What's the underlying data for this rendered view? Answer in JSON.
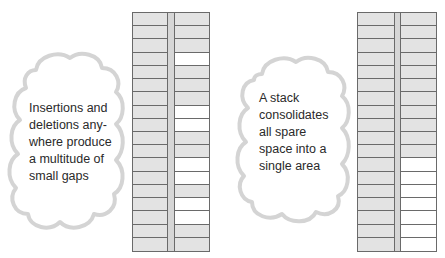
{
  "colors": {
    "cell_used": "#e3e3e3",
    "cell_free": "#ffffff",
    "line": "#6a6a6a",
    "cloud_outline": "#d4d4d4",
    "text": "#2a2a2a"
  },
  "left_panel": {
    "caption_lines": [
      "Insertions and",
      "deletions any-",
      "where produce",
      "a multitude of",
      "small gaps"
    ],
    "stack": {
      "rows": 18,
      "right_column": [
        "used",
        "used",
        "used",
        "free",
        "used",
        "used",
        "used",
        "free",
        "free",
        "used",
        "used",
        "free",
        "free",
        "used",
        "free",
        "free",
        "used",
        "used"
      ]
    }
  },
  "right_panel": {
    "caption_lines": [
      "A stack",
      "consolidates",
      "all spare",
      "space into a",
      "single area"
    ],
    "stack": {
      "rows": 18,
      "right_column": [
        "used",
        "used",
        "used",
        "used",
        "used",
        "used",
        "used",
        "used",
        "used",
        "used",
        "used",
        "free",
        "free",
        "free",
        "free",
        "free",
        "free",
        "free"
      ]
    }
  }
}
